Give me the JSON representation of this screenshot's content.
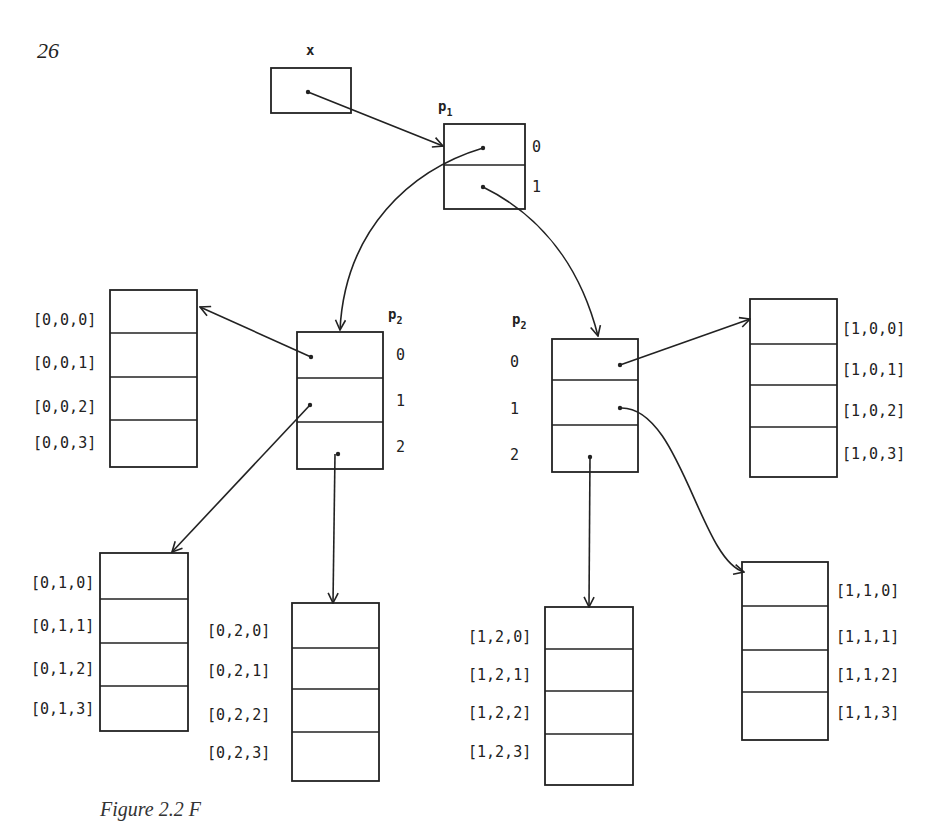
{
  "page_number": "26",
  "caption_fragment": "Figure 2.2 F",
  "variable_x": {
    "label": "x"
  },
  "p1": {
    "label": "p",
    "subscript": "1",
    "indices": [
      "0",
      "1"
    ]
  },
  "p2_left": {
    "label": "p",
    "subscript": "2",
    "indices": [
      "0",
      "1",
      "2"
    ]
  },
  "p2_right": {
    "label": "p",
    "subscript": "2",
    "indices": [
      "0",
      "1",
      "2"
    ]
  },
  "leaf_arrays": {
    "a000": [
      "[0,0,0]",
      "[0,0,1]",
      "[0,0,2]",
      "[0,0,3]"
    ],
    "a010": [
      "[0,1,0]",
      "[0,1,1]",
      "[0,1,2]",
      "[0,1,3]"
    ],
    "a020": [
      "[0,2,0]",
      "[0,2,1]",
      "[0,2,2]",
      "[0,2,3]"
    ],
    "a100": [
      "[1,0,0]",
      "[1,0,1]",
      "[1,0,2]",
      "[1,0,3]"
    ],
    "a110": [
      "[1,1,0]",
      "[1,1,1]",
      "[1,1,2]",
      "[1,1,3]"
    ],
    "a120": [
      "[1,2,0]",
      "[1,2,1]",
      "[1,2,2]",
      "[1,2,3]"
    ]
  }
}
